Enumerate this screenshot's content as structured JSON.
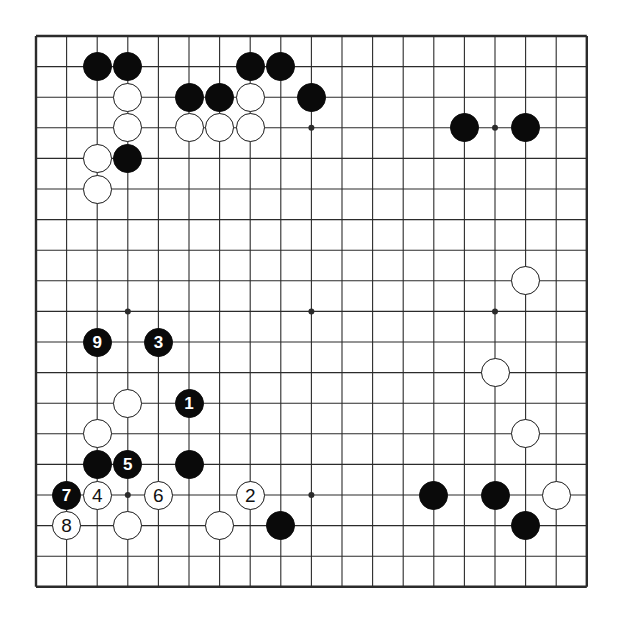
{
  "diagram": {
    "type": "go-board-diagram",
    "board_size": 19,
    "colors": {
      "background": "#ffffff",
      "line": "#2b2b2b",
      "black_stone": "#0a0a0a",
      "white_stone": "#ffffff",
      "white_stone_edge": "#1a1a1a",
      "black_label_text": "#ffffff",
      "white_label_text": "#111111"
    },
    "geometry": {
      "origin_x": 36,
      "origin_y": 36,
      "spacing": 30.6,
      "stone_radius": 14.5,
      "star_point_radius": 3
    },
    "star_points": [
      {
        "col": 4,
        "row": 4
      },
      {
        "col": 10,
        "row": 4
      },
      {
        "col": 16,
        "row": 4
      },
      {
        "col": 4,
        "row": 10
      },
      {
        "col": 10,
        "row": 10
      },
      {
        "col": 16,
        "row": 10
      },
      {
        "col": 4,
        "row": 16
      },
      {
        "col": 10,
        "row": 16
      },
      {
        "col": 16,
        "row": 16
      }
    ],
    "stones": [
      {
        "col": 3,
        "row": 2,
        "color": "black",
        "label": ""
      },
      {
        "col": 4,
        "row": 2,
        "color": "black",
        "label": ""
      },
      {
        "col": 8,
        "row": 2,
        "color": "black",
        "label": ""
      },
      {
        "col": 9,
        "row": 2,
        "color": "black",
        "label": ""
      },
      {
        "col": 4,
        "row": 3,
        "color": "white",
        "label": ""
      },
      {
        "col": 6,
        "row": 3,
        "color": "black",
        "label": ""
      },
      {
        "col": 7,
        "row": 3,
        "color": "black",
        "label": ""
      },
      {
        "col": 8,
        "row": 3,
        "color": "white",
        "label": ""
      },
      {
        "col": 10,
        "row": 3,
        "color": "black",
        "label": ""
      },
      {
        "col": 4,
        "row": 4,
        "color": "white",
        "label": ""
      },
      {
        "col": 6,
        "row": 4,
        "color": "white",
        "label": ""
      },
      {
        "col": 7,
        "row": 4,
        "color": "white",
        "label": ""
      },
      {
        "col": 8,
        "row": 4,
        "color": "white",
        "label": ""
      },
      {
        "col": 15,
        "row": 4,
        "color": "black",
        "label": ""
      },
      {
        "col": 17,
        "row": 4,
        "color": "black",
        "label": ""
      },
      {
        "col": 3,
        "row": 5,
        "color": "white",
        "label": ""
      },
      {
        "col": 4,
        "row": 5,
        "color": "black",
        "label": ""
      },
      {
        "col": 3,
        "row": 6,
        "color": "white",
        "label": ""
      },
      {
        "col": 17,
        "row": 9,
        "color": "white",
        "label": ""
      },
      {
        "col": 3,
        "row": 11,
        "color": "black",
        "label": "9"
      },
      {
        "col": 5,
        "row": 11,
        "color": "black",
        "label": "3"
      },
      {
        "col": 4,
        "row": 13,
        "color": "white",
        "label": ""
      },
      {
        "col": 6,
        "row": 13,
        "color": "black",
        "label": "1"
      },
      {
        "col": 16,
        "row": 12,
        "color": "white",
        "label": ""
      },
      {
        "col": 3,
        "row": 14,
        "color": "white",
        "label": ""
      },
      {
        "col": 17,
        "row": 14,
        "color": "white",
        "label": ""
      },
      {
        "col": 3,
        "row": 15,
        "color": "black",
        "label": ""
      },
      {
        "col": 4,
        "row": 15,
        "color": "black",
        "label": "5"
      },
      {
        "col": 6,
        "row": 15,
        "color": "black",
        "label": ""
      },
      {
        "col": 2,
        "row": 16,
        "color": "black",
        "label": "7"
      },
      {
        "col": 3,
        "row": 16,
        "color": "white",
        "label": "4"
      },
      {
        "col": 5,
        "row": 16,
        "color": "white",
        "label": "6"
      },
      {
        "col": 8,
        "row": 16,
        "color": "white",
        "label": "2"
      },
      {
        "col": 14,
        "row": 16,
        "color": "black",
        "label": ""
      },
      {
        "col": 16,
        "row": 16,
        "color": "black",
        "label": ""
      },
      {
        "col": 18,
        "row": 16,
        "color": "white",
        "label": ""
      },
      {
        "col": 2,
        "row": 17,
        "color": "white",
        "label": "8"
      },
      {
        "col": 4,
        "row": 17,
        "color": "white",
        "label": ""
      },
      {
        "col": 7,
        "row": 17,
        "color": "white",
        "label": ""
      },
      {
        "col": 9,
        "row": 17,
        "color": "black",
        "label": ""
      },
      {
        "col": 17,
        "row": 17,
        "color": "black",
        "label": ""
      }
    ],
    "move_sequence": [
      {
        "number": "1",
        "color": "black"
      },
      {
        "number": "2",
        "color": "white"
      },
      {
        "number": "3",
        "color": "black"
      },
      {
        "number": "4",
        "color": "white"
      },
      {
        "number": "5",
        "color": "black"
      },
      {
        "number": "6",
        "color": "white"
      },
      {
        "number": "7",
        "color": "black"
      },
      {
        "number": "8",
        "color": "white"
      },
      {
        "number": "9",
        "color": "black"
      }
    ]
  }
}
